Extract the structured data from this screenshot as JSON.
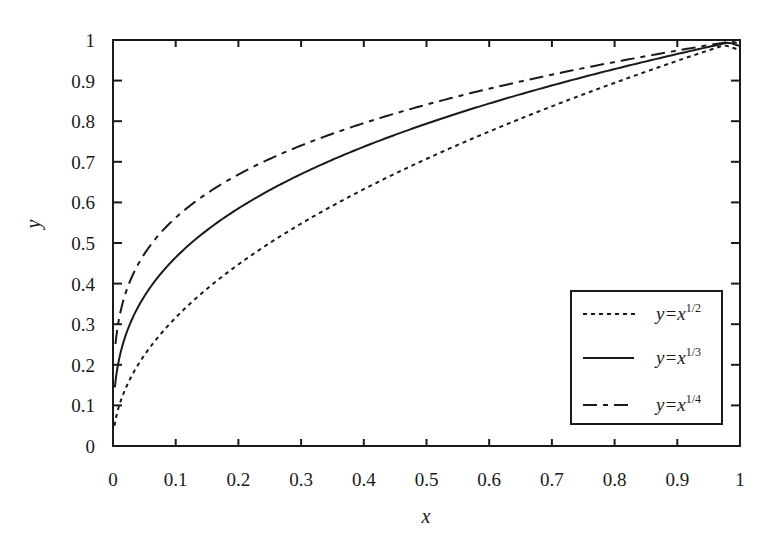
{
  "chart_data": {
    "type": "line",
    "title": "",
    "xlabel": "x",
    "ylabel": "y",
    "xlim": [
      0,
      1
    ],
    "ylim": [
      0,
      1
    ],
    "grid": false,
    "x_ticks": [
      "0",
      "0.1",
      "0.2",
      "0.3",
      "0.4",
      "0.5",
      "0.6",
      "0.7",
      "0.8",
      "0.9",
      "1"
    ],
    "y_ticks": [
      "0",
      "0.1",
      "0.2",
      "0.3",
      "0.4",
      "0.5",
      "0.6",
      "0.7",
      "0.8",
      "0.9",
      "1"
    ],
    "legend_position": "bottom-right",
    "series": [
      {
        "name": "y=x^1/2",
        "label_base": "y=x",
        "label_sup": "1/2",
        "style": "dotted",
        "exponent": 0.5,
        "x": [
          0.0025,
          0.01,
          0.05,
          0.1,
          0.2,
          0.3,
          0.4,
          0.5,
          0.6,
          0.7,
          0.8,
          0.9,
          1.0
        ],
        "values": [
          0.05,
          0.1,
          0.224,
          0.316,
          0.447,
          0.548,
          0.632,
          0.707,
          0.775,
          0.837,
          0.894,
          0.949,
          0.975
        ]
      },
      {
        "name": "y=x^1/3",
        "label_base": "y=x",
        "label_sup": "1/3",
        "style": "solid",
        "exponent": 0.333,
        "x": [
          0.003,
          0.01,
          0.05,
          0.1,
          0.2,
          0.3,
          0.4,
          0.5,
          0.6,
          0.7,
          0.8,
          0.9,
          1.0
        ],
        "values": [
          0.144,
          0.215,
          0.368,
          0.464,
          0.585,
          0.669,
          0.737,
          0.794,
          0.843,
          0.888,
          0.928,
          0.965,
          0.985
        ]
      },
      {
        "name": "y=x^1/4",
        "label_base": "y=x",
        "label_sup": "1/4",
        "style": "dash",
        "exponent": 0.25,
        "x": [
          0.004,
          0.01,
          0.05,
          0.1,
          0.2,
          0.3,
          0.4,
          0.5,
          0.6,
          0.7,
          0.8,
          0.9,
          1.0
        ],
        "values": [
          0.25,
          0.316,
          0.473,
          0.562,
          0.669,
          0.74,
          0.795,
          0.841,
          0.88,
          0.915,
          0.946,
          0.974,
          0.99
        ]
      }
    ]
  }
}
